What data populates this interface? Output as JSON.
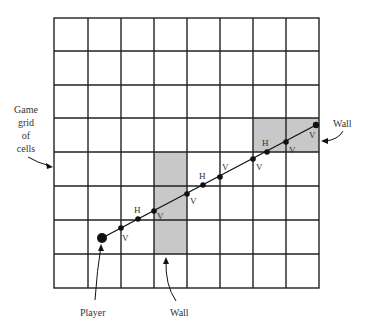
{
  "figure": {
    "grid": {
      "rows": 8,
      "cols": 8
    },
    "labels": {
      "grid_label_lines": [
        "Game",
        "grid",
        "of",
        "cells"
      ],
      "player": "Player",
      "wall_bottom": "Wall",
      "wall_right": "Wall"
    },
    "intersection_markers": [
      "V",
      "H",
      "V",
      "V",
      "H",
      "V",
      "V",
      "H",
      "V",
      "V"
    ],
    "colors": {
      "grid_line": "#222222",
      "wall_fill": "#c8c8c8",
      "ray": "#111111"
    }
  }
}
